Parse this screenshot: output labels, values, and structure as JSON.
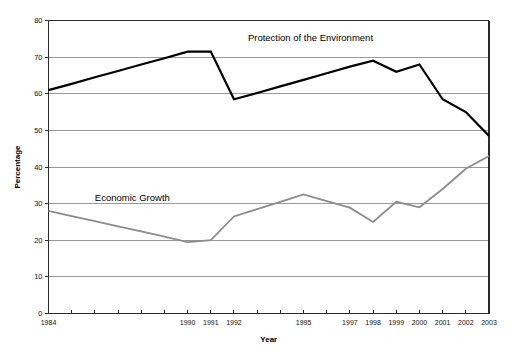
{
  "chart_data": {
    "type": "line",
    "title": "",
    "xlabel": "Year",
    "ylabel": "Percentage",
    "ylim": [
      0,
      80
    ],
    "ytick_step": 10,
    "yticks": [
      0,
      10,
      20,
      30,
      40,
      50,
      60,
      70,
      80
    ],
    "xlim": [
      1984,
      2003
    ],
    "x": [
      1984,
      1985,
      1986,
      1987,
      1988,
      1989,
      1990,
      1991,
      1992,
      1993,
      1994,
      1995,
      1996,
      1997,
      1998,
      1999,
      2000,
      2001,
      2002,
      2003
    ],
    "xtick_labels_visible": [
      "1984",
      "1990",
      "1991",
      "1992",
      "1995",
      "1997",
      "1998",
      "1999",
      "2000",
      "2001",
      "2002",
      "2003"
    ],
    "grid": "horizontal",
    "legend_position": "inline-annotations",
    "series": [
      {
        "name": "Protection of the Environment",
        "color": "#000000",
        "width": 2.2,
        "label_x": 1992.6,
        "label_y": 74.5,
        "values": [
          61,
          62.7,
          64.5,
          66.2,
          68,
          69.7,
          71.5,
          71.5,
          58.5,
          60.2,
          62.0,
          63.8,
          65.6,
          67.4,
          69.0,
          66.0,
          68.0,
          58.5,
          55.0,
          48.5
        ]
      },
      {
        "name": "Economic Growth",
        "color": "#8c8c8c",
        "width": 1.8,
        "label_x": 1986.0,
        "label_y": 30.6,
        "values": [
          28,
          26.6,
          25.2,
          23.8,
          22.4,
          21.0,
          19.5,
          20.0,
          26.5,
          28.5,
          30.5,
          32.5,
          30.7,
          28.9,
          25.0,
          30.5,
          29.0,
          34.0,
          39.5,
          43.0
        ]
      }
    ],
    "annotations": [
      {
        "text": "Protection of the Environment",
        "x": 1992.6,
        "y": 74.5
      },
      {
        "text": "Economic Growth",
        "x": 1986.0,
        "y": 30.6
      }
    ]
  },
  "axes": {
    "y_title": "Percentage",
    "x_title": "Year",
    "y_tick_texts": [
      "80",
      "70",
      "60",
      "50",
      "40",
      "30",
      "20",
      "10",
      "0"
    ],
    "x_tick_texts": [
      {
        "year": 1984,
        "text": "1984"
      },
      {
        "year": 1990,
        "text": "1990"
      },
      {
        "year": 1991,
        "text": "1991"
      },
      {
        "year": 1992,
        "text": "1992"
      },
      {
        "year": 1995,
        "text": "1995"
      },
      {
        "year": 1997,
        "text": "1997"
      },
      {
        "year": 1998,
        "text": "1998"
      },
      {
        "year": 1999,
        "text": "1999"
      },
      {
        "year": 2000,
        "text": "2000"
      },
      {
        "year": 2001,
        "text": "2001"
      },
      {
        "year": 2002,
        "text": "2002"
      },
      {
        "year": 2003,
        "text": "2003"
      }
    ]
  },
  "colors": {
    "environment_line": "#000000",
    "economy_line": "#8c8c8c",
    "gridline": "#9a9a9a",
    "axis": "#2b2b2b",
    "background": "#ffffff"
  }
}
